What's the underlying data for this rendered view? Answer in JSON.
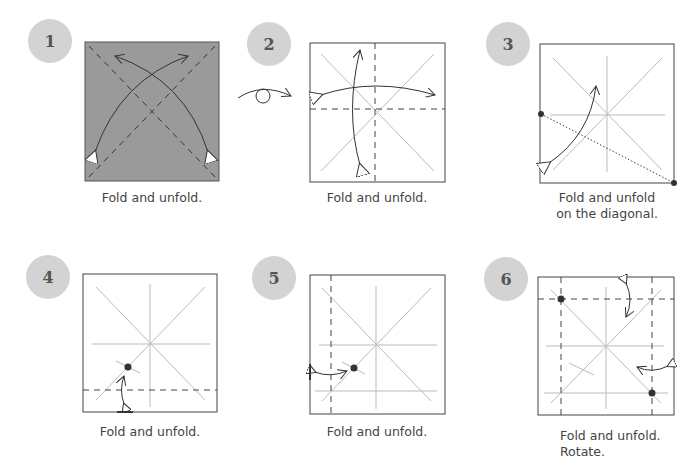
{
  "steps": [
    {
      "number": "1",
      "caption_line1": "Fold and unfold.",
      "caption_line2": ""
    },
    {
      "number": "2",
      "caption_line1": "Fold and unfold.",
      "caption_line2": ""
    },
    {
      "number": "3",
      "caption_line1": "Fold and unfold",
      "caption_line2": "on the diagonal."
    },
    {
      "number": "4",
      "caption_line1": "Fold and unfold.",
      "caption_line2": ""
    },
    {
      "number": "5",
      "caption_line1": "Fold and unfold.",
      "caption_line2": ""
    },
    {
      "number": "6",
      "caption_line1": "Fold and unfold.",
      "caption_line2": "Rotate."
    }
  ],
  "colors": {
    "step_circle": "#d3d3d3",
    "paper_colored": "#9a9a9a",
    "paper_white": "#ffffff",
    "crease": "#b8b8b8",
    "outline": "#444444",
    "text": "#444444"
  },
  "symbols": {
    "turn_over": "turn-over-icon",
    "valley_fold": "dashed-line",
    "reference_point": "dot"
  }
}
